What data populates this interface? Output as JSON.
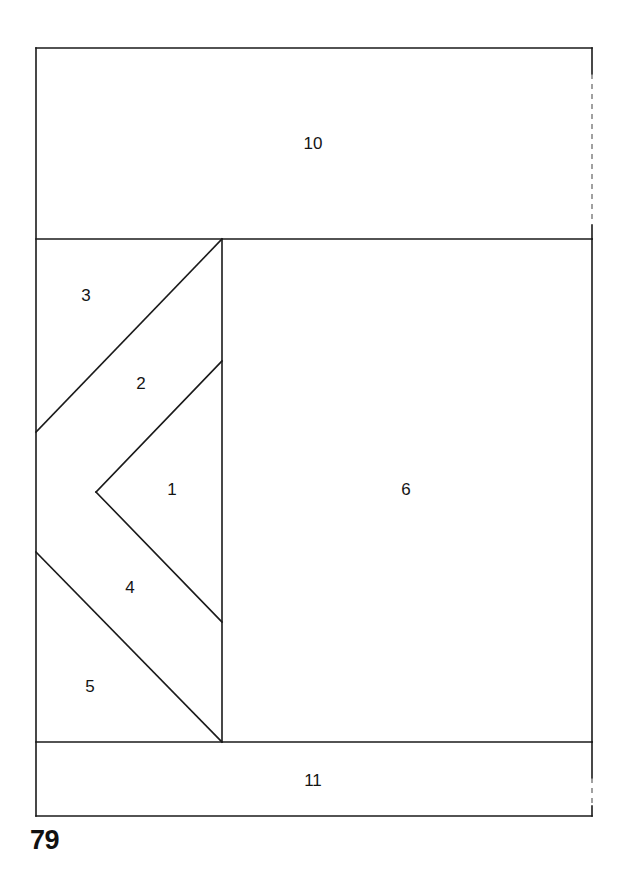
{
  "page": {
    "number": "79",
    "background_color": "#ffffff",
    "width": 627,
    "height": 869
  },
  "figure": {
    "stroke_color": "#1a1a1a",
    "stroke_width": 1.6,
    "dashed_stroke_color": "#6e6e6e",
    "outer_rect": {
      "x": 36,
      "y": 48,
      "width": 556,
      "height": 768
    },
    "regions": [
      {
        "id": "region-1",
        "label": "1",
        "label_x": 172,
        "label_y": 491,
        "shape": "triangle",
        "points": "96,492 222,361 222,622"
      },
      {
        "id": "region-2",
        "label": "2",
        "label_x": 141,
        "label_y": 385,
        "shape": "parallelogram-strip",
        "points": "36,432 222,239 222,361 96,492"
      },
      {
        "id": "region-3",
        "label": "3",
        "label_x": 86,
        "label_y": 297,
        "shape": "triangle",
        "points": "36,239 222,239 36,432"
      },
      {
        "id": "region-4",
        "label": "4",
        "label_x": 130,
        "label_y": 589,
        "shape": "parallelogram-strip",
        "points": "96,492 222,622 222,742 36,552"
      },
      {
        "id": "region-5",
        "label": "5",
        "label_x": 90,
        "label_y": 688,
        "shape": "triangle",
        "points": "36,552 222,742 36,742"
      },
      {
        "id": "region-6",
        "label": "6",
        "label_x": 406,
        "label_y": 491,
        "shape": "rectangle",
        "points": "222,239 592,239 592,742 222,742"
      },
      {
        "id": "region-10",
        "label": "10",
        "label_x": 313,
        "label_y": 145,
        "shape": "rectangle",
        "points": "36,48 592,48 592,239 36,239"
      },
      {
        "id": "region-11",
        "label": "11",
        "label_x": 313,
        "label_y": 782,
        "shape": "rectangle",
        "points": "36,742 592,742 592,816 36,816"
      }
    ],
    "solid_lines": [
      {
        "name": "outer-top-edge",
        "x1": 36,
        "y1": 48,
        "x2": 592,
        "y2": 48
      },
      {
        "name": "outer-left-edge",
        "x1": 36,
        "y1": 48,
        "x2": 36,
        "y2": 816
      },
      {
        "name": "outer-bottom-edge",
        "x1": 36,
        "y1": 816,
        "x2": 592,
        "y2": 816
      },
      {
        "name": "divider-below-region-10",
        "x1": 36,
        "y1": 239,
        "x2": 592,
        "y2": 239
      },
      {
        "name": "divider-above-region-11",
        "x1": 36,
        "y1": 742,
        "x2": 592,
        "y2": 742
      },
      {
        "name": "vertical-divider-middle",
        "x1": 222,
        "y1": 239,
        "x2": 222,
        "y2": 742
      },
      {
        "name": "right-edge-middle-band",
        "x1": 592,
        "y1": 239,
        "x2": 592,
        "y2": 742
      },
      {
        "name": "diagonal-region-3-to-2",
        "x1": 36,
        "y1": 432,
        "x2": 222,
        "y2": 239
      },
      {
        "name": "diagonal-region-2-to-1",
        "x1": 96,
        "y1": 492,
        "x2": 222,
        "y2": 361
      },
      {
        "name": "diagonal-region-1-to-4",
        "x1": 96,
        "y1": 492,
        "x2": 222,
        "y2": 622
      },
      {
        "name": "diagonal-region-4-to-5",
        "x1": 36,
        "y1": 552,
        "x2": 222,
        "y2": 742
      },
      {
        "name": "right-edge-region-10-top-stub",
        "x1": 592,
        "y1": 48,
        "x2": 592,
        "y2": 74
      },
      {
        "name": "right-edge-region-10-bottom-stub",
        "x1": 592,
        "y1": 225,
        "x2": 592,
        "y2": 239
      },
      {
        "name": "right-edge-region-11-top-stub",
        "x1": 592,
        "y1": 742,
        "x2": 592,
        "y2": 778
      },
      {
        "name": "right-edge-region-11-bottom-stub",
        "x1": 592,
        "y1": 806,
        "x2": 592,
        "y2": 816
      }
    ],
    "dashed_lines": [
      {
        "name": "right-edge-region-10-dashed",
        "x1": 592,
        "y1": 74,
        "x2": 592,
        "y2": 225
      },
      {
        "name": "right-edge-region-11-dashed",
        "x1": 592,
        "y1": 778,
        "x2": 592,
        "y2": 806
      }
    ]
  }
}
